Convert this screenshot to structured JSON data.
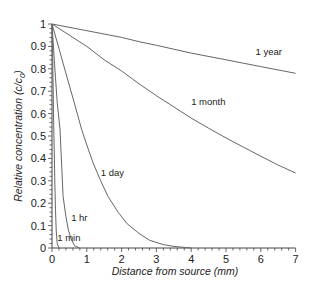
{
  "chart_data": {
    "type": "line",
    "title": "",
    "xlabel": "Distance from source (mm)",
    "ylabel": "Relative concentration (c/c",
    "ylabel_sub": "0",
    "ylabel_close": ")",
    "xlim": [
      0,
      7
    ],
    "ylim": [
      0,
      1
    ],
    "xticks": [
      0,
      1,
      2,
      3,
      4,
      5,
      6,
      7
    ],
    "xtick_labels": [
      "0",
      "1",
      "2",
      "3",
      "4",
      "5",
      "6",
      "7"
    ],
    "yticks": [
      0,
      0.1,
      0.2,
      0.3,
      0.4,
      0.5,
      0.6,
      0.7,
      0.8,
      0.9,
      1
    ],
    "ytick_labels": [
      "0",
      "0.1",
      "0.2",
      "0.3",
      "0.4",
      "0.5",
      "0.6",
      "0.7",
      "0.8",
      "0.9",
      "1"
    ],
    "x_minor_step": 0.2,
    "y_minor_step": 0.02,
    "grid": false,
    "legend": "inline labels",
    "series": [
      {
        "name": "1 min",
        "label_pos": [
          0.15,
          0.03
        ],
        "x": [
          0,
          0.02,
          0.05,
          0.08,
          0.1,
          0.12,
          0.15,
          0.2
        ],
        "y": [
          1,
          0.85,
          0.55,
          0.3,
          0.17,
          0.08,
          0.02,
          0
        ]
      },
      {
        "name": "1 hr",
        "label_pos": [
          0.55,
          0.12
        ],
        "x": [
          0,
          0.05,
          0.1,
          0.15,
          0.23,
          0.32,
          0.4,
          0.47,
          0.55,
          0.65,
          0.8
        ],
        "y": [
          1,
          0.88,
          0.76,
          0.65,
          0.53,
          0.23,
          0.14,
          0.08,
          0.04,
          0.01,
          0
        ]
      },
      {
        "name": "1 day",
        "label_pos": [
          1.4,
          0.32
        ],
        "x": [
          0,
          0.2,
          0.4,
          0.6,
          0.85,
          1.0,
          1.18,
          1.4,
          1.61,
          1.9,
          2.15,
          2.5,
          2.8,
          3.2,
          3.5,
          4.0
        ],
        "y": [
          1,
          0.89,
          0.78,
          0.67,
          0.53,
          0.46,
          0.38,
          0.3,
          0.23,
          0.16,
          0.11,
          0.065,
          0.035,
          0.015,
          0.007,
          0
        ]
      },
      {
        "name": "1 month",
        "label_pos": [
          4.0,
          0.64
        ],
        "x": [
          0,
          0.5,
          1,
          1.5,
          2,
          2.53,
          3,
          3.5,
          4,
          4.5,
          4.9,
          5.5,
          6,
          6.5,
          7
        ],
        "y": [
          1,
          0.95,
          0.9,
          0.84,
          0.79,
          0.73,
          0.68,
          0.63,
          0.58,
          0.535,
          0.5,
          0.45,
          0.41,
          0.37,
          0.335
        ]
      },
      {
        "name": "1 year",
        "label_pos": [
          5.85,
          0.86
        ],
        "x": [
          0,
          1,
          2,
          2.53,
          3,
          4,
          5,
          6,
          7
        ],
        "y": [
          1,
          0.97,
          0.94,
          0.92,
          0.905,
          0.87,
          0.84,
          0.81,
          0.78
        ]
      }
    ],
    "line_color": "#666666"
  }
}
